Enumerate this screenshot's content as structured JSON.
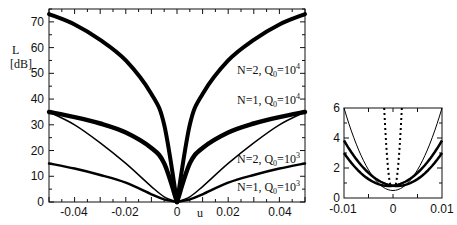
{
  "chart_data": [
    {
      "type": "line",
      "title": "",
      "xlabel": "u",
      "ylabel": "L [dB]",
      "xlim": [
        -0.05,
        0.05
      ],
      "ylim": [
        0,
        75
      ],
      "xticks": [
        "-0.04",
        "-0.02",
        "0",
        "0.02",
        "0.04"
      ],
      "yticks": [
        "0",
        "10",
        "20",
        "30",
        "40",
        "50",
        "60",
        "70"
      ],
      "grid": false,
      "x": [
        -0.05,
        -0.04,
        -0.03,
        -0.02,
        -0.01,
        -0.005,
        0,
        0.005,
        0.01,
        0.02,
        0.03,
        0.04,
        0.05
      ],
      "series": [
        {
          "name": "N=2, Q0=10^4",
          "values": [
            73,
            69,
            63,
            55,
            42,
            30,
            0,
            30,
            42,
            55,
            63,
            69,
            73
          ]
        },
        {
          "name": "N=1, Q0=10^4",
          "values": [
            35,
            33,
            30.5,
            27,
            21,
            15,
            0,
            15,
            21,
            27,
            30.5,
            33,
            35
          ]
        },
        {
          "name": "N=2, Q0=10^3",
          "values": [
            35,
            30,
            23,
            15,
            6,
            2,
            0,
            2,
            6,
            15,
            23,
            30,
            35
          ]
        },
        {
          "name": "N=1, Q0=10^3",
          "values": [
            15,
            13,
            10.5,
            7.5,
            3,
            1,
            0,
            1,
            3,
            7.5,
            10.5,
            13,
            15
          ]
        }
      ],
      "annotations": [
        "N=2, Q0=10^4",
        "N=1, Q0=10^4",
        "N=2, Q0=10^3",
        "N=1, Q0=10^3"
      ]
    },
    {
      "type": "line",
      "title": "",
      "xlabel": "",
      "ylabel": "",
      "xlim": [
        -0.01,
        0.01
      ],
      "ylim": [
        0,
        6
      ],
      "xticks": [
        "-0.01",
        "0",
        "0.01"
      ],
      "yticks": [
        "0",
        "2",
        "4",
        "6"
      ],
      "grid": false,
      "x": [
        -0.01,
        -0.005,
        -0.002,
        0,
        0.002,
        0.005,
        0.01
      ],
      "series": [
        {
          "name": "thin",
          "values": [
            6,
            2,
            0.8,
            0.5,
            0.8,
            2,
            6
          ]
        },
        {
          "name": "thick",
          "values": [
            3.2,
            1.5,
            0.9,
            0.8,
            0.9,
            1.5,
            3.2
          ]
        },
        {
          "name": "dotted",
          "values": [
            null,
            null,
            6,
            0.6,
            6,
            null,
            null
          ]
        }
      ]
    }
  ],
  "labels": {
    "y_axis": "L",
    "y_unit": "[dB]",
    "x_axis": "u",
    "ann1": "N=2,  Q",
    "ann2": "N=1,  Q",
    "ann3": "N=2,  Q",
    "ann4": "N=1,  Q",
    "sub": "0",
    "eq1": "=10",
    "sup4": "4",
    "sup3": "3"
  }
}
